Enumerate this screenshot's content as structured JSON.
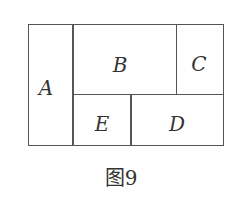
{
  "diagram": {
    "regions": [
      {
        "id": "A",
        "label": "A"
      },
      {
        "id": "B",
        "label": "B"
      },
      {
        "id": "C",
        "label": "C"
      },
      {
        "id": "D",
        "label": "D"
      },
      {
        "id": "E",
        "label": "E"
      }
    ],
    "caption": "图9",
    "line_color": "#555555"
  }
}
